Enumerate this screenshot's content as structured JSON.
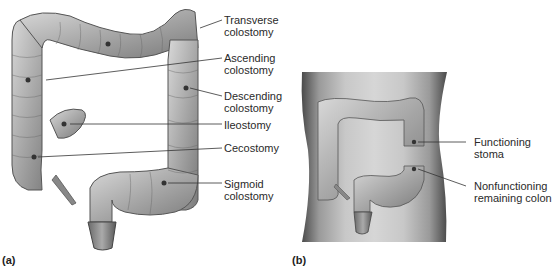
{
  "figure": {
    "panels": [
      {
        "id": "a",
        "letter": "(a)",
        "labels": [
          {
            "text": "Transverse\ncolostomy"
          },
          {
            "text": "Ascending\ncolostomy"
          },
          {
            "text": "Descending\ncolostomy"
          },
          {
            "text": "Ileostomy"
          },
          {
            "text": "Cecostomy"
          },
          {
            "text": "Sigmoid\ncolostomy"
          }
        ]
      },
      {
        "id": "b",
        "letter": "(b)",
        "labels": [
          {
            "text": "Functioning\nstoma"
          },
          {
            "text": "Nonfunctioning\nremaining colon"
          }
        ]
      }
    ]
  }
}
